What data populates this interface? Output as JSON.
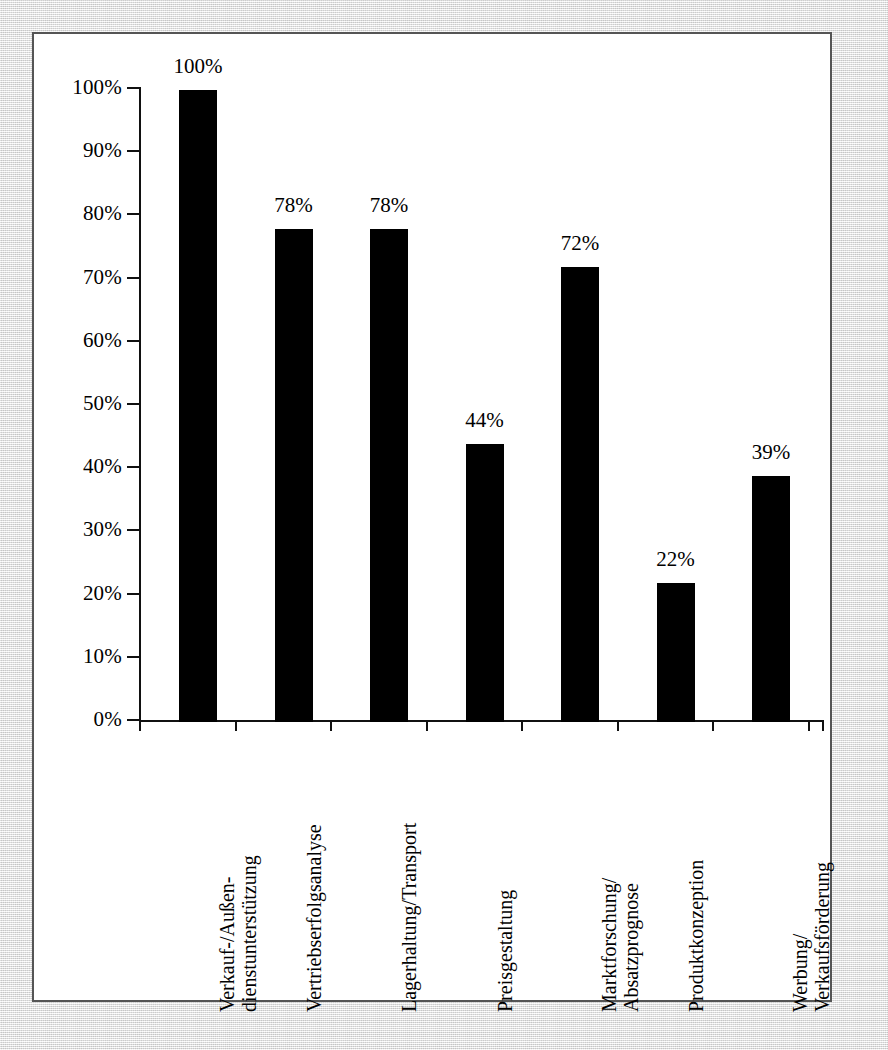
{
  "chart_data": {
    "type": "bar",
    "title": "",
    "subtitle": "",
    "xlabel": "",
    "ylabel": "",
    "ylim": [
      0,
      100
    ],
    "grid": false,
    "legend": "none",
    "orientation": "vertical",
    "bar_color": "#000000",
    "value_label_suffix": "%",
    "categories": [
      "Verkauf-/Außen-\ndienstunterstützung",
      "Vertriebserfolgsanalyse",
      "Lagerhaltung/Transport",
      "Preisgestaltung",
      "Marktforschung/\nAbsatzprognose",
      "Produktkonzeption",
      "Werbung/\nVerkaufsförderung"
    ],
    "category_lines": [
      [
        "Verkauf-/Außen-",
        "dienstunterstützung"
      ],
      [
        "Vertriebserfolgsanalyse",
        ""
      ],
      [
        "Lagerhaltung/Transport",
        ""
      ],
      [
        "Preisgestaltung",
        ""
      ],
      [
        "Marktforschung/",
        "Absatzprognose"
      ],
      [
        "Produktkonzeption",
        ""
      ],
      [
        "Werbung/",
        "Verkaufsförderung"
      ]
    ],
    "values": [
      100,
      78,
      78,
      44,
      72,
      22,
      39
    ],
    "value_labels": [
      "100%",
      "78%",
      "78%",
      "44%",
      "72%",
      "22%",
      "39%"
    ],
    "yticks": [
      0,
      10,
      20,
      30,
      40,
      50,
      60,
      70,
      80,
      90,
      100
    ],
    "ytick_labels": [
      "0%",
      "10%",
      "20%",
      "30%",
      "40%",
      "50%",
      "60%",
      "70%",
      "80%",
      "90%",
      "100%"
    ]
  },
  "figure": {
    "background_color": "#e8e8e8",
    "panel_color": "#ffffff",
    "border_color": "#555555",
    "axis_color": "#111111",
    "text_color": "#000000"
  }
}
